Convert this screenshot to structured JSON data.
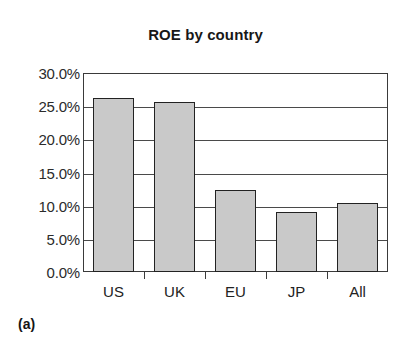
{
  "figure": {
    "panel_label": "(a)",
    "background_color": "#ffffff"
  },
  "chart_data": {
    "type": "bar",
    "title": "ROE by country",
    "xlabel": "",
    "ylabel": "",
    "categories": [
      "US",
      "UK",
      "EU",
      "JP",
      "All"
    ],
    "values": [
      26.3,
      25.7,
      12.4,
      9.0,
      10.4
    ],
    "value_labels": [
      "26.3%",
      "25.7%",
      "12.4%",
      "9.0%",
      "10.4%"
    ],
    "ylim": [
      0,
      30
    ],
    "ytick_values": [
      0,
      5,
      10,
      15,
      20,
      25,
      30
    ],
    "ytick_labels": [
      "0.0%",
      "5.0%",
      "10.0%",
      "15.0%",
      "20.0%",
      "25.0%",
      "30.0%"
    ],
    "grid": true,
    "grid_axis": "y",
    "legend": false,
    "legend_position": "none",
    "bar_fill_color": "#c9c9c9",
    "bar_edge_color": "#222222",
    "axis_color": "#3a3a3a",
    "unit": "percent"
  }
}
